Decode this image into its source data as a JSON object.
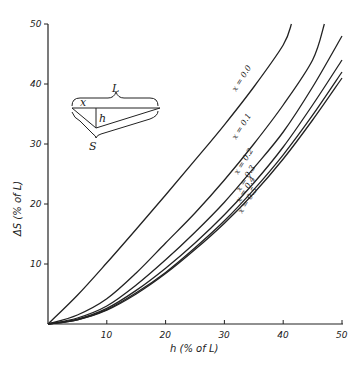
{
  "chart_data": {
    "type": "line",
    "title": "",
    "xlabel": "h (% of L)",
    "ylabel": "ΔS (% of L)",
    "xlim": [
      0,
      50
    ],
    "ylim": [
      0,
      50
    ],
    "xticks": [
      10,
      20,
      30,
      40,
      50
    ],
    "yticks": [
      10,
      20,
      30,
      40,
      50
    ],
    "grid": false,
    "legend": "inline curve labels",
    "series": [
      {
        "name": "x = 0.0",
        "points": [
          [
            0,
            0
          ],
          [
            5,
            4.8
          ],
          [
            10,
            10.2
          ],
          [
            15,
            15.8
          ],
          [
            20,
            21.5
          ],
          [
            25,
            27.3
          ],
          [
            30,
            33.2
          ],
          [
            35,
            39.5
          ],
          [
            40,
            46.5
          ],
          [
            41.4,
            50
          ]
        ]
      },
      {
        "name": "x = 0.1",
        "points": [
          [
            0,
            0
          ],
          [
            5,
            1.5
          ],
          [
            10,
            4.2
          ],
          [
            15,
            8.5
          ],
          [
            20,
            13.5
          ],
          [
            25,
            18.5
          ],
          [
            30,
            24
          ],
          [
            35,
            30
          ],
          [
            40,
            36.5
          ],
          [
            45,
            44
          ],
          [
            47,
            50
          ]
        ]
      },
      {
        "name": "x = 0.2",
        "points": [
          [
            0,
            0
          ],
          [
            5,
            1
          ],
          [
            10,
            3
          ],
          [
            15,
            6.5
          ],
          [
            20,
            10.7
          ],
          [
            25,
            15.3
          ],
          [
            30,
            20.3
          ],
          [
            35,
            26
          ],
          [
            40,
            32
          ],
          [
            45,
            39.5
          ],
          [
            50,
            48
          ]
        ]
      },
      {
        "name": "x = 0.3",
        "points": [
          [
            0,
            0
          ],
          [
            5,
            0.8
          ],
          [
            10,
            2.6
          ],
          [
            15,
            5.6
          ],
          [
            20,
            9.3
          ],
          [
            25,
            13.5
          ],
          [
            30,
            18.2
          ],
          [
            35,
            23.5
          ],
          [
            40,
            29.5
          ],
          [
            45,
            36.5
          ],
          [
            50,
            44
          ]
        ]
      },
      {
        "name": "x = 0.4",
        "points": [
          [
            0,
            0
          ],
          [
            5,
            0.7
          ],
          [
            10,
            2.4
          ],
          [
            15,
            5.2
          ],
          [
            20,
            8.6
          ],
          [
            25,
            12.7
          ],
          [
            30,
            17.2
          ],
          [
            35,
            22.4
          ],
          [
            40,
            28.2
          ],
          [
            45,
            34.8
          ],
          [
            50,
            42
          ]
        ]
      },
      {
        "name": "x = 0.5",
        "points": [
          [
            0,
            0
          ],
          [
            5,
            0.7
          ],
          [
            10,
            2.3
          ],
          [
            15,
            5
          ],
          [
            20,
            8.4
          ],
          [
            25,
            12.4
          ],
          [
            30,
            16.8
          ],
          [
            35,
            21.8
          ],
          [
            40,
            27.5
          ],
          [
            45,
            34
          ],
          [
            50,
            41
          ]
        ]
      }
    ],
    "annotations": [
      "x = 0.0",
      "x = 0.1",
      "x = 0.2",
      "x = 0.3",
      "x = 0.4",
      "x = 0.5"
    ]
  },
  "axes": {
    "x_title": "h (% of L)",
    "y_title": "ΔS (% of L)",
    "x_ticks": [
      "10",
      "20",
      "30",
      "40",
      "50"
    ],
    "y_ticks": [
      "10",
      "20",
      "30",
      "40",
      "50"
    ]
  },
  "curve_labels": [
    "x = 0.0",
    "x = 0.1",
    "x = 0.2",
    "x = 0.3",
    "x = 0.4",
    "x = 0.5"
  ],
  "inset_diagram": {
    "L_label": "L",
    "x_label": "x",
    "h_label": "h",
    "S_label": "S"
  }
}
